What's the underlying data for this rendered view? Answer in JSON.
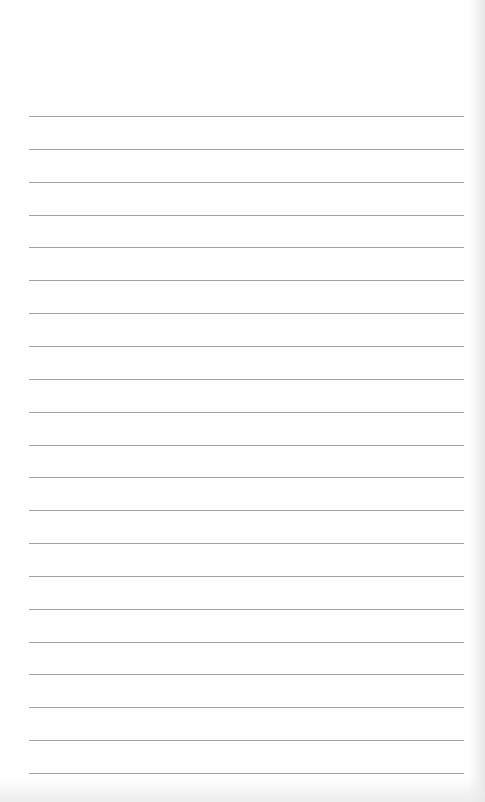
{
  "page": {
    "type": "blank lined notebook page",
    "text_content": "",
    "ruled_lines": {
      "count": 21,
      "first_line_y": 116,
      "spacing_px": 32.85,
      "left_x": 29,
      "right_x": 464,
      "color": "#a4a4a4"
    },
    "colors": {
      "paper": "#fefefe",
      "edge_shadow": "#e4e4e4"
    }
  }
}
